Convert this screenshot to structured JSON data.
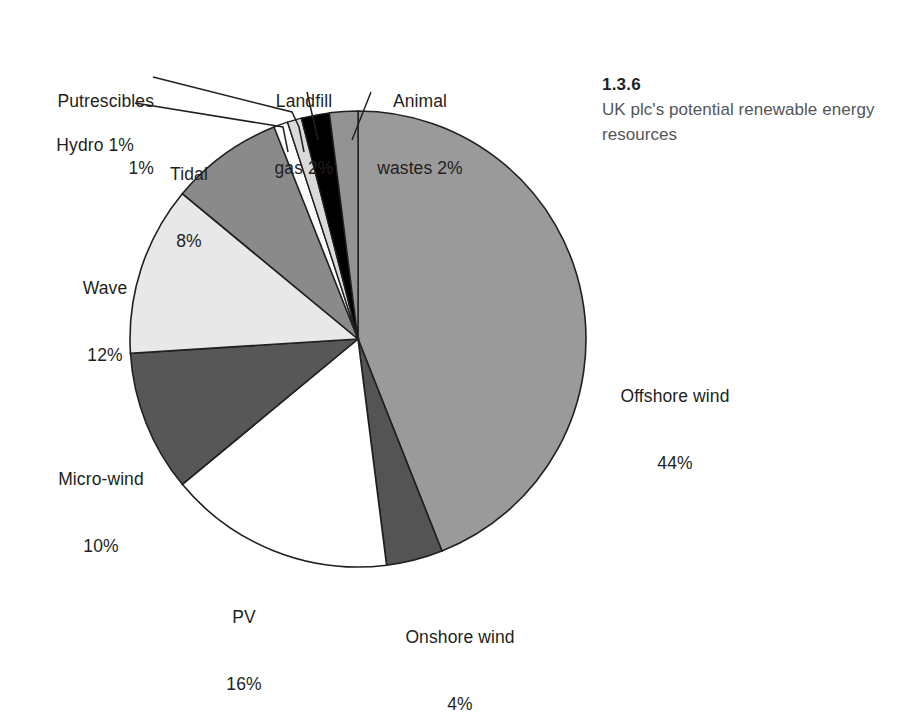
{
  "caption": {
    "number": "1.3.6",
    "text": "UK plc's potential renewable energy resources"
  },
  "chart_data": {
    "type": "pie",
    "title": "UK plc's potential renewable energy resources",
    "subtitle": "1.3.6",
    "unit": "%",
    "total": 100,
    "legend_position": "callout-labels",
    "grid": false,
    "start_angle_deg": 0,
    "direction": "clockwise",
    "categories": [
      "Offshore wind",
      "Onshore wind",
      "PV",
      "Micro-wind",
      "Wave",
      "Tidal",
      "Hydro",
      "Putrescibles",
      "Landfill gas",
      "Animal wastes"
    ],
    "values": [
      44,
      4,
      16,
      10,
      12,
      8,
      1,
      1,
      2,
      2
    ],
    "colors": [
      "#9a9a9a",
      "#545454",
      "#ffffff",
      "#575757",
      "#e8e8e8",
      "#8a8a8a",
      "#fbfbfb",
      "#d9d9d9",
      "#000000",
      "#939393"
    ],
    "slices": [
      {
        "name": "Offshore wind",
        "value": 44,
        "label_line1": "Offshore wind",
        "label_line2": "44%",
        "color": "#9a9a9a"
      },
      {
        "name": "Onshore wind",
        "value": 4,
        "label_line1": "Onshore wind",
        "label_line2": "4%",
        "color": "#545454"
      },
      {
        "name": "PV",
        "value": 16,
        "label_line1": "PV",
        "label_line2": "16%",
        "color": "#ffffff"
      },
      {
        "name": "Micro-wind",
        "value": 10,
        "label_line1": "Micro-wind",
        "label_line2": "10%",
        "color": "#575757"
      },
      {
        "name": "Wave",
        "value": 12,
        "label_line1": "Wave",
        "label_line2": "12%",
        "color": "#e8e8e8"
      },
      {
        "name": "Tidal",
        "value": 8,
        "label_line1": "Tidal",
        "label_line2": "8%",
        "color": "#8a8a8a"
      },
      {
        "name": "Hydro",
        "value": 1,
        "label_line1": "Hydro 1%",
        "label_line2": "",
        "color": "#fbfbfb"
      },
      {
        "name": "Putrescibles",
        "value": 1,
        "label_line1": "Putrescibles",
        "label_line2": "1%",
        "color": "#d9d9d9"
      },
      {
        "name": "Landfill gas",
        "value": 2,
        "label_line1": "Landfill",
        "label_line2": "gas 2%",
        "color": "#000000"
      },
      {
        "name": "Animal wastes",
        "value": 2,
        "label_line1": "Animal",
        "label_line2": "wastes 2%",
        "color": "#939393"
      }
    ]
  },
  "labels": {
    "offshore_wind": {
      "line1": "Offshore wind",
      "line2": "44%"
    },
    "onshore_wind": {
      "line1": "Onshore wind",
      "line2": "4%"
    },
    "pv": {
      "line1": "PV",
      "line2": "16%"
    },
    "micro_wind": {
      "line1": "Micro-wind",
      "line2": "10%"
    },
    "wave": {
      "line1": "Wave",
      "line2": "12%"
    },
    "tidal": {
      "line1": "Tidal",
      "line2": "8%"
    },
    "hydro": {
      "line1": "Hydro 1%",
      "line2": ""
    },
    "putrescibles": {
      "line1": "Putrescibles",
      "line2": "1%"
    },
    "landfill_gas": {
      "line1": "Landfill",
      "line2": "gas 2%"
    },
    "animal_wastes": {
      "line1": "Animal",
      "line2": "wastes 2%"
    }
  }
}
